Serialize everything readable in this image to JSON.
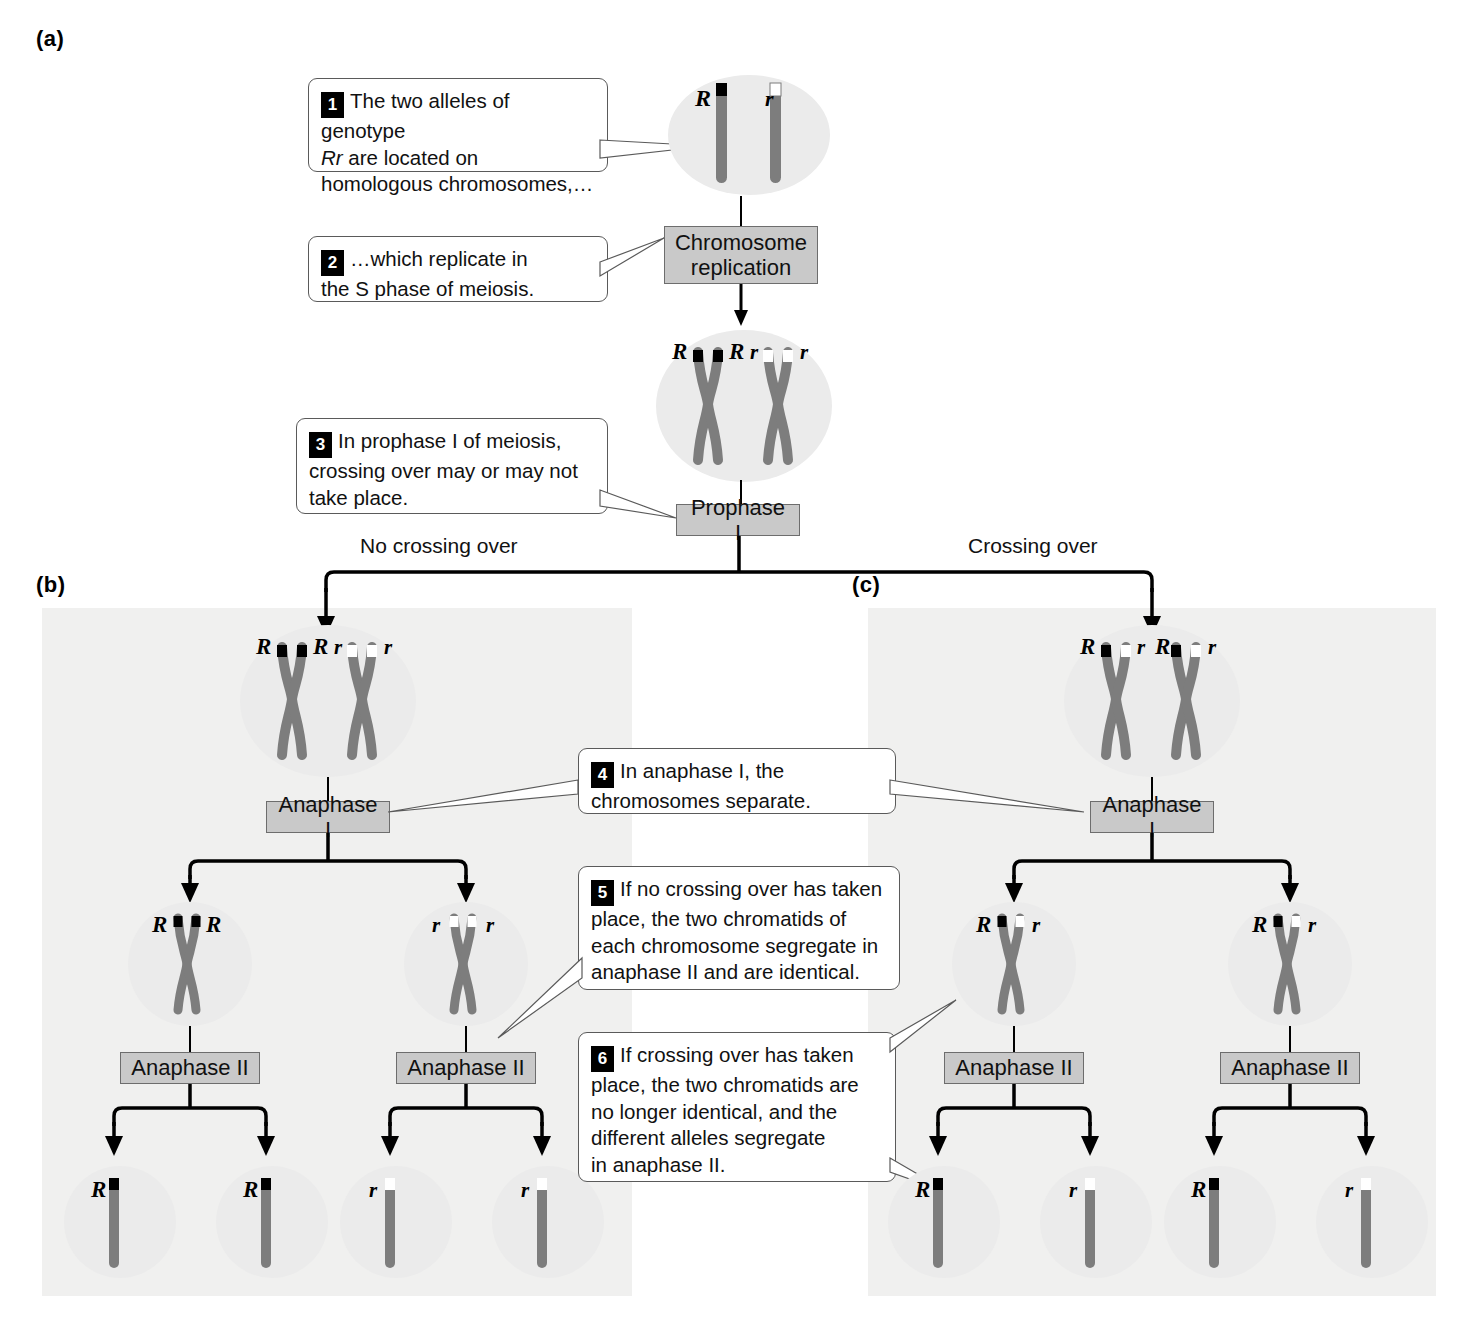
{
  "panels": {
    "a": "(a)",
    "b": "(b)",
    "c": "(c)"
  },
  "callouts": [
    {
      "num": "1",
      "text": "The two alleles of genotype Rr are located on homologous chromosomes,…",
      "line1": "The two alleles of genotype",
      "line2_italic": "Rr",
      "line2_rest": " are located on",
      "line3": "homologous chromosomes,…"
    },
    {
      "num": "2",
      "line1": "…which replicate in",
      "line2": "the S phase of meiosis."
    },
    {
      "num": "3",
      "line1": "In prophase I of meiosis,",
      "line2": "crossing over may or may not",
      "line3": "take place."
    },
    {
      "num": "4",
      "line1": "In anaphase I, the",
      "line2": "chromosomes separate."
    },
    {
      "num": "5",
      "line1": "If no crossing over has taken",
      "line2": "place, the two chromatids of",
      "line3": "each chromosome segregate in",
      "line4": "anaphase II and are identical."
    },
    {
      "num": "6",
      "line1": "If crossing over has taken",
      "line2": "place, the two chromatids are",
      "line3": "no longer identical, and the",
      "line4": "different alleles segregate",
      "line5": "in anaphase II."
    }
  ],
  "stages": {
    "chromosome_replication_l1": "Chromosome",
    "chromosome_replication_l2": "replication",
    "prophase_i": "Prophase I",
    "anaphase_i": "Anaphase I",
    "anaphase_ii": "Anaphase II"
  },
  "branch_labels": {
    "no_crossing_over": "No crossing over",
    "crossing_over": "Crossing over"
  },
  "alleles": {
    "R": "R",
    "r": "r"
  },
  "cells": {
    "a_unreplicated": {
      "labels": [
        "R",
        "r"
      ]
    },
    "a_replicated": {
      "labels": [
        "R",
        "R",
        "r",
        "r"
      ]
    },
    "b_prophase": {
      "labels": [
        "R",
        "R",
        "r",
        "r"
      ]
    },
    "b_anaphase1_left": {
      "labels": [
        "R",
        "R"
      ]
    },
    "b_anaphase1_right": {
      "labels": [
        "r",
        "r"
      ]
    },
    "b_gametes": [
      "R",
      "R",
      "r",
      "r"
    ],
    "c_prophase": {
      "labels": [
        "R",
        "r",
        "R",
        "r"
      ]
    },
    "c_anaphase1_left": {
      "labels": [
        "R",
        "r"
      ]
    },
    "c_anaphase1_right": {
      "labels": [
        "R",
        "r"
      ]
    },
    "c_gametes": [
      "R",
      "r",
      "R",
      "r"
    ]
  },
  "colors": {
    "chromosome_body": "#7d7d7d",
    "allele_R_band": "#000000",
    "allele_r_band": "#ffffff",
    "cell_fill": "#ebebeb",
    "panel_bg": "#f0f0ef",
    "stage_box_fill": "#c9c9c9",
    "stage_box_border": "#6d6d6d",
    "callout_border": "#5a5a5a",
    "connector": "#000000"
  }
}
